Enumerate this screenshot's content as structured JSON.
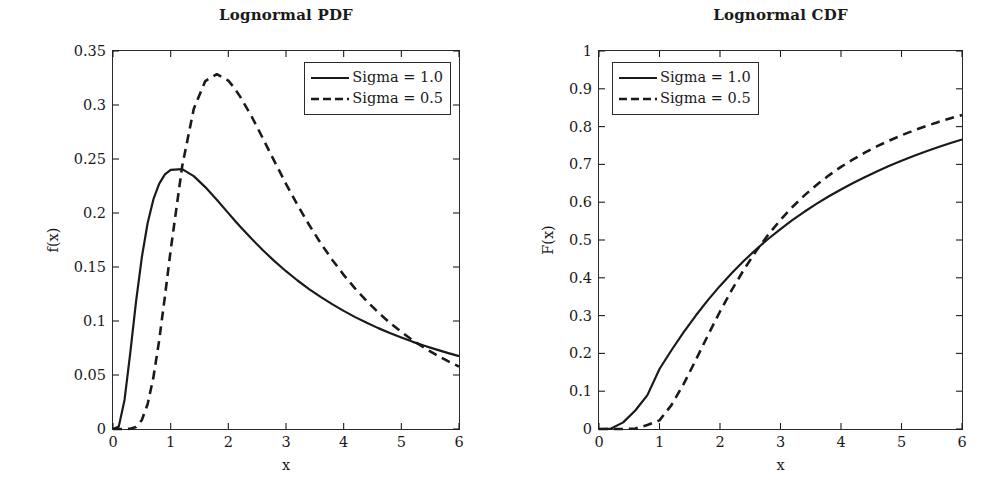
{
  "figure": {
    "background": "#ffffff",
    "line_color": "#1a1a1a"
  },
  "panels": [
    {
      "id": "pdf",
      "title": "Lognormal PDF",
      "xlabel": "x",
      "ylabel": "f(x)",
      "xticks": [
        "0",
        "1",
        "2",
        "3",
        "4",
        "5",
        "6"
      ],
      "yticks": [
        "0",
        "0.05",
        "0.1",
        "0.15",
        "0.2",
        "0.25",
        "0.3",
        "0.35"
      ],
      "legend_position": "upper-right",
      "legend": [
        {
          "label": "Sigma = 1.0",
          "style": "solid"
        },
        {
          "label": "Sigma = 0.5",
          "style": "dashed"
        }
      ]
    },
    {
      "id": "cdf",
      "title": "Lognormal CDF",
      "xlabel": "x",
      "ylabel": "F(x)",
      "xticks": [
        "0",
        "1",
        "2",
        "3",
        "4",
        "5",
        "6"
      ],
      "yticks": [
        "0",
        "0.1",
        "0.2",
        "0.3",
        "0.4",
        "0.5",
        "0.6",
        "0.7",
        "0.8",
        "0.9",
        "1"
      ],
      "legend_position": "upper-left",
      "legend": [
        {
          "label": "Sigma = 1.0",
          "style": "solid"
        },
        {
          "label": "Sigma = 0.5",
          "style": "dashed"
        }
      ]
    }
  ],
  "chart_data": [
    {
      "type": "line",
      "title": "Lognormal PDF",
      "xlabel": "x",
      "ylabel": "f(x)",
      "xlim": [
        0,
        6
      ],
      "ylim": [
        0,
        0.35
      ],
      "grid": false,
      "legend_position": "upper right",
      "xticks": [
        0,
        1,
        2,
        3,
        4,
        5,
        6
      ],
      "yticks": [
        0,
        0.05,
        0.1,
        0.15,
        0.2,
        0.25,
        0.3,
        0.35
      ],
      "x": [
        0,
        0.1,
        0.2,
        0.3,
        0.4,
        0.5,
        0.6,
        0.7,
        0.8,
        0.9,
        1.0,
        1.2,
        1.4,
        1.6,
        1.8,
        2.0,
        2.1,
        2.2,
        2.4,
        2.6,
        2.8,
        3.0,
        3.2,
        3.4,
        3.6,
        3.8,
        4.0,
        4.2,
        4.4,
        4.6,
        4.8,
        5.0,
        5.2,
        5.4,
        5.6,
        5.8,
        6.0
      ],
      "series": [
        {
          "name": "Sigma = 1.0",
          "style": "solid",
          "values": [
            0,
            0.0022,
            0.0269,
            0.0707,
            0.1181,
            0.159,
            0.1905,
            0.2126,
            0.227,
            0.2357,
            0.24,
            0.2406,
            0.2341,
            0.224,
            0.2122,
            0.1999,
            0.1938,
            0.1878,
            0.1763,
            0.1655,
            0.1554,
            0.1461,
            0.1375,
            0.1296,
            0.1223,
            0.1156,
            0.1094,
            0.1036,
            0.0983,
            0.0934,
            0.0889,
            0.0847,
            0.0807,
            0.0771,
            0.0737,
            0.0705,
            0.0675
          ]
        },
        {
          "name": "Sigma = 0.5",
          "style": "dashed",
          "values": [
            0,
            0.0,
            0.0,
            0.0002,
            0.0019,
            0.0083,
            0.0229,
            0.0476,
            0.0818,
            0.1226,
            0.1655,
            0.2434,
            0.2963,
            0.3222,
            0.3285,
            0.3226,
            0.3161,
            0.3082,
            0.2898,
            0.269,
            0.2478,
            0.227,
            0.2074,
            0.1891,
            0.1722,
            0.1568,
            0.1427,
            0.13,
            0.1184,
            0.1079,
            0.0984,
            0.0899,
            0.0821,
            0.0751,
            0.0688,
            0.063,
            0.0578
          ]
        }
      ],
      "annotations": [
        "Sigma=1.0 peaks ~0.242 near x=1.0",
        "Sigma=0.5 peaks ~0.333 near x=2.1",
        "curves cross near x=5.3"
      ]
    },
    {
      "type": "line",
      "title": "Lognormal CDF",
      "xlabel": "x",
      "ylabel": "F(x)",
      "xlim": [
        0,
        6
      ],
      "ylim": [
        0,
        1
      ],
      "grid": false,
      "legend_position": "upper left",
      "xticks": [
        0,
        1,
        2,
        3,
        4,
        5,
        6
      ],
      "yticks": [
        0,
        0.1,
        0.2,
        0.3,
        0.4,
        0.5,
        0.6,
        0.7,
        0.8,
        0.9,
        1
      ],
      "x": [
        0,
        0.2,
        0.4,
        0.6,
        0.8,
        1.0,
        1.2,
        1.4,
        1.6,
        1.8,
        2.0,
        2.2,
        2.4,
        2.6,
        2.8,
        3.0,
        3.2,
        3.4,
        3.6,
        3.8,
        4.0,
        4.2,
        4.4,
        4.6,
        4.8,
        5.0,
        5.2,
        5.4,
        5.6,
        5.8,
        6.0
      ],
      "series": [
        {
          "name": "Sigma = 1.0",
          "style": "solid",
          "values": [
            0,
            0.0014,
            0.0175,
            0.049,
            0.0896,
            0.1587,
            0.209,
            0.2562,
            0.3002,
            0.3409,
            0.3786,
            0.4134,
            0.4457,
            0.4756,
            0.5033,
            0.529,
            0.553,
            0.5753,
            0.5961,
            0.6156,
            0.6338,
            0.6509,
            0.6669,
            0.682,
            0.6962,
            0.7095,
            0.7221,
            0.734,
            0.7452,
            0.7558,
            0.7659
          ]
        },
        {
          "name": "Sigma = 0.5",
          "style": "dashed",
          "values": [
            0,
            0.0,
            0.0,
            0.0014,
            0.0104,
            0.0228,
            0.0639,
            0.1193,
            0.1825,
            0.2475,
            0.3108,
            0.3693,
            0.4229,
            0.4714,
            0.5147,
            0.5533,
            0.5879,
            0.6187,
            0.6463,
            0.6711,
            0.6934,
            0.7135,
            0.7317,
            0.7483,
            0.7633,
            0.777,
            0.7896,
            0.8011,
            0.8117,
            0.8215,
            0.8305
          ]
        }
      ],
      "annotations": [
        "curves cross near x=2.7 at F=0.5",
        "at x=6: Sigma=1.0 ~0.78, Sigma=0.5 ~0.94"
      ]
    }
  ]
}
